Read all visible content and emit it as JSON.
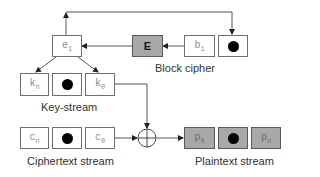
{
  "diagram": {
    "block_cipher": {
      "label": "Block cipher",
      "e_box": {
        "symbol": "e",
        "subscript": "1"
      },
      "cipher_box": {
        "symbol": "E"
      },
      "b_box": {
        "symbol": "b",
        "subscript": "1"
      },
      "dot_box": {
        "icon": "bullet-dot-icon"
      }
    },
    "key_stream": {
      "label": "Key-stream",
      "items": [
        {
          "symbol": "k",
          "subscript": "n"
        },
        {
          "icon": "bullet-dot-icon"
        },
        {
          "symbol": "k",
          "subscript": "0"
        }
      ]
    },
    "ciphertext_stream": {
      "label": "Ciphertext stream",
      "items": [
        {
          "symbol": "c",
          "subscript": "n"
        },
        {
          "icon": "bullet-dot-icon"
        },
        {
          "symbol": "c",
          "subscript": "0"
        }
      ]
    },
    "xor": {
      "icon": "xor-circle-icon"
    },
    "plaintext_stream": {
      "label": "Plaintext stream",
      "items": [
        {
          "symbol": "p",
          "subscript": "0"
        },
        {
          "icon": "bullet-dot-icon"
        },
        {
          "symbol": "p",
          "subscript": "n"
        }
      ]
    },
    "colors": {
      "box_border": "#6e6e6e",
      "gray_fill": "#a8a8a8",
      "line": "#555555",
      "text": "#333333"
    }
  }
}
